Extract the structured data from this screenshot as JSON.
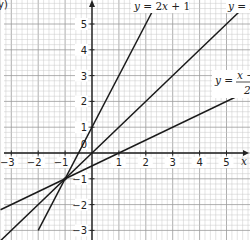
{
  "chart_data": {
    "type": "line",
    "title": "",
    "xlabel": "x",
    "ylabel": "y",
    "xlim": [
      -3.4,
      5.9
    ],
    "ylim": [
      -3.1,
      5.9
    ],
    "grid": true,
    "grid_minor_step": 0.2,
    "x_ticks": [
      -3,
      -2,
      -1,
      1,
      2,
      3,
      4,
      5
    ],
    "x_tick_labels": [
      "−3",
      "−2",
      "−1",
      "1",
      "2",
      "3",
      "4",
      "5"
    ],
    "y_ticks": [
      -3,
      -2,
      -1,
      1,
      2,
      3,
      4,
      5
    ],
    "y_tick_labels": [
      "−3",
      "−2",
      "−1",
      "1",
      "2",
      "3",
      "4",
      "5"
    ],
    "origin_label": "0",
    "series": [
      {
        "name": "y = 2x + 1",
        "slope": 2,
        "intercept": 1,
        "x_range": [
          -2,
          2.3
        ],
        "label_parts": [
          "y",
          " = 2",
          "x",
          " + 1"
        ]
      },
      {
        "name": "y = x",
        "slope": 1,
        "intercept": 0,
        "x_range": [
          -3.4,
          5.6
        ],
        "label_parts": [
          "y",
          " = ",
          "x"
        ]
      },
      {
        "name": "y = (x − 1)/2",
        "slope": 0.5,
        "intercept": -0.5,
        "x_range": [
          -3.4,
          5.9
        ],
        "label_parts": [
          "y",
          " = ",
          "x −",
          "2"
        ]
      }
    ],
    "intersection_point": {
      "x": -1,
      "y": -1
    },
    "partial_label_top_left": "y)"
  }
}
